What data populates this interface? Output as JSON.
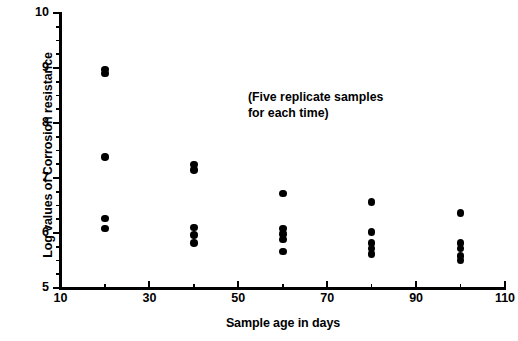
{
  "chart_data": {
    "type": "scatter",
    "title": "",
    "xlabel": "Sample age in days",
    "ylabel": "Log values of Corrosion resistance",
    "xlim": [
      10,
      110
    ],
    "ylim": [
      5,
      10
    ],
    "xticks": [
      10,
      30,
      50,
      70,
      90,
      110
    ],
    "xtick_labels": [
      "10",
      "30",
      "50",
      "70",
      "90",
      "110"
    ],
    "xminor_ticks": [
      20,
      40,
      60,
      80,
      100
    ],
    "yticks": [
      5,
      6,
      7,
      8,
      9,
      10
    ],
    "ytick_labels": [
      "5",
      "6",
      "7",
      "8",
      "9",
      "10"
    ],
    "yminor_ticks": [
      5.25,
      5.5,
      5.75,
      6.25,
      6.5,
      6.75,
      7.25,
      7.5,
      7.75,
      8.25,
      8.5,
      8.75,
      9.25,
      9.5,
      9.75
    ],
    "grid": false,
    "legend": null,
    "marker": "filled-circle",
    "marker_color": "#000000",
    "annotations": [
      {
        "text": "(Five replicate samples\nfor each time)",
        "x": 62,
        "y": 8.55
      }
    ],
    "series": [
      {
        "name": "Corrosion resistance (log)",
        "points": [
          {
            "x": 20,
            "y": 8.97
          },
          {
            "x": 20,
            "y": 8.9
          },
          {
            "x": 20,
            "y": 7.38
          },
          {
            "x": 20,
            "y": 6.26
          },
          {
            "x": 20,
            "y": 6.08
          },
          {
            "x": 40,
            "y": 7.25
          },
          {
            "x": 40,
            "y": 7.15
          },
          {
            "x": 40,
            "y": 6.1
          },
          {
            "x": 40,
            "y": 5.96
          },
          {
            "x": 40,
            "y": 5.82
          },
          {
            "x": 60,
            "y": 6.72
          },
          {
            "x": 60,
            "y": 6.08
          },
          {
            "x": 60,
            "y": 5.98
          },
          {
            "x": 60,
            "y": 5.88
          },
          {
            "x": 60,
            "y": 5.66
          },
          {
            "x": 80,
            "y": 6.56
          },
          {
            "x": 80,
            "y": 6.02
          },
          {
            "x": 80,
            "y": 5.82
          },
          {
            "x": 80,
            "y": 5.72
          },
          {
            "x": 80,
            "y": 5.62
          },
          {
            "x": 100,
            "y": 6.36
          },
          {
            "x": 100,
            "y": 5.82
          },
          {
            "x": 100,
            "y": 5.72
          },
          {
            "x": 100,
            "y": 5.58
          },
          {
            "x": 100,
            "y": 5.5
          }
        ]
      }
    ]
  }
}
